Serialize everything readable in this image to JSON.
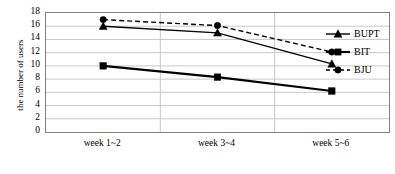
{
  "chart_data": {
    "type": "line",
    "title": "",
    "xlabel": "",
    "ylabel": "the number of users",
    "categories": [
      "week 1~2",
      "week 3~4",
      "week 5~6"
    ],
    "ylim": [
      0,
      18
    ],
    "y_ticks": [
      0,
      2,
      4,
      6,
      8,
      10,
      12,
      14,
      16,
      18
    ],
    "y_tick_labels": [
      "0",
      "2",
      "4",
      "6",
      "8",
      "10",
      "12",
      "14",
      "16",
      "18"
    ],
    "grid": "horizontal-and-vertical",
    "legend_position": "right",
    "series": [
      {
        "name": "BUPT",
        "marker": "triangle",
        "line_style": "solid",
        "color": "#000000",
        "values": [
          16,
          15,
          10.3
        ]
      },
      {
        "name": "BIT",
        "marker": "square",
        "line_style": "solid",
        "color": "#000000",
        "values": [
          10,
          8.3,
          6.2
        ]
      },
      {
        "name": "BJU",
        "marker": "circle",
        "line_style": "dashed",
        "color": "#000000",
        "values": [
          17,
          16.1,
          12.1
        ]
      }
    ]
  },
  "axes": {
    "y_title": "the number of users"
  },
  "legend": {
    "items": [
      {
        "label": "BUPT",
        "marker": "triangle-marker",
        "line_style": "solid"
      },
      {
        "label": "BIT",
        "marker": "square-marker",
        "line_style": "solid"
      },
      {
        "label": "BJU",
        "marker": "circle-marker",
        "line_style": "dashed"
      }
    ]
  },
  "colors": {
    "series": "#000000",
    "gridline": "#c8c8c8",
    "frame": "#808080",
    "background": "#ffffff"
  }
}
